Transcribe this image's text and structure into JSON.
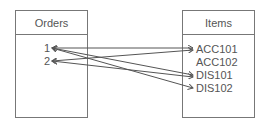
{
  "left_table": {
    "title": "Orders",
    "items": [
      "1",
      "2"
    ]
  },
  "right_table": {
    "title": "Items",
    "items": [
      "ACC101",
      "ACC102",
      "DIS101",
      "DIS102"
    ]
  },
  "connections": [
    {
      "from": "1",
      "to": "ACC101"
    },
    {
      "from": "1",
      "to": "DIS101"
    },
    {
      "from": "1",
      "to": "DIS102"
    },
    {
      "from": "2",
      "to": "ACC101"
    },
    {
      "from": "2",
      "to": "DIS101"
    }
  ],
  "colors": {
    "border": "#777777",
    "line": "#555555",
    "text": "#555555"
  }
}
